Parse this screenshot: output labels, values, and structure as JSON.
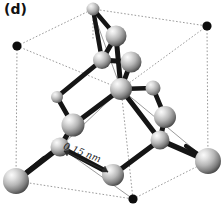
{
  "figure": {
    "panel_label": "(d)",
    "dimension_label": "0.15 nm",
    "structure_type": "diamond-cubic-unit-cell",
    "colors": {
      "background": "#ffffff",
      "bond": "#151515",
      "cube_edge_dashed": "#9a9a9a",
      "cube_edge_solid": "#8d8d8d",
      "corner_dot": "#0d0d0d",
      "sphere_highlight": "#f2f2f2",
      "sphere_mid": "#b4b4b4",
      "sphere_shadow": "#4a4a4a",
      "label_text": "#111111"
    },
    "cube_corners": [
      {
        "id": "back-top-left",
        "x": 17,
        "y": 46,
        "style": "black-dot",
        "r": 4.6
      },
      {
        "id": "back-top-right",
        "x": 207,
        "y": 26,
        "style": "black-dot",
        "r": 4.6
      },
      {
        "id": "front-top-left",
        "x": 4,
        "y": 110,
        "style": "hidden",
        "r": 0
      },
      {
        "id": "front-top-right",
        "x": 196,
        "y": 90,
        "style": "hidden",
        "r": 0
      },
      {
        "id": "back-bot-left",
        "x": 17,
        "y": 146,
        "style": "hidden",
        "r": 0
      },
      {
        "id": "back-bot-right",
        "x": 207,
        "y": 126,
        "style": "hidden",
        "r": 0
      },
      {
        "id": "front-bot-left",
        "x": 16,
        "y": 181,
        "style": "gray-sphere",
        "r": 13
      },
      {
        "id": "front-bot-center",
        "x": 133,
        "y": 199,
        "style": "black-dot",
        "r": 4.6
      },
      {
        "id": "front-bot-right",
        "x": 208,
        "y": 161,
        "style": "gray-sphere",
        "r": 13
      },
      {
        "id": "top-face-center",
        "x": 93,
        "y": 9,
        "style": "gray-sphere",
        "r": 6.5
      }
    ],
    "atoms": [
      {
        "id": "a-top-apex",
        "x": 93,
        "y": 9,
        "r": 6.5
      },
      {
        "id": "a-upper-right",
        "x": 116,
        "y": 36,
        "r": 10.5
      },
      {
        "id": "a-upper-mid",
        "x": 102,
        "y": 60,
        "r": 9
      },
      {
        "id": "a-upper-far",
        "x": 131,
        "y": 62,
        "r": 10.5
      },
      {
        "id": "a-center",
        "x": 121,
        "y": 89,
        "r": 11
      },
      {
        "id": "a-right-small",
        "x": 153,
        "y": 88,
        "r": 7.5
      },
      {
        "id": "a-left-small",
        "x": 57,
        "y": 97,
        "r": 6
      },
      {
        "id": "a-mid-left",
        "x": 73,
        "y": 125,
        "r": 11.5
      },
      {
        "id": "a-right-mid",
        "x": 165,
        "y": 117,
        "r": 11
      },
      {
        "id": "a-front-left",
        "x": 60,
        "y": 147,
        "r": 9.5
      },
      {
        "id": "a-front-right",
        "x": 160,
        "y": 140,
        "r": 9.5
      },
      {
        "id": "a-front-bot",
        "x": 113,
        "y": 175,
        "r": 11
      },
      {
        "id": "a-corner-bl",
        "x": 16,
        "y": 181,
        "r": 13
      },
      {
        "id": "a-corner-br",
        "x": 208,
        "y": 161,
        "r": 13
      }
    ],
    "bonds": [
      {
        "from": "a-top-apex",
        "to": "a-upper-right"
      },
      {
        "from": "a-top-apex",
        "to": "a-upper-mid"
      },
      {
        "from": "a-upper-right",
        "to": "a-upper-mid"
      },
      {
        "from": "a-upper-right",
        "to": "a-center"
      },
      {
        "from": "a-upper-mid",
        "to": "a-upper-far"
      },
      {
        "from": "a-upper-mid",
        "to": "a-left-small"
      },
      {
        "from": "a-upper-far",
        "to": "a-center"
      },
      {
        "from": "a-center",
        "to": "a-right-small"
      },
      {
        "from": "a-center",
        "to": "a-mid-left"
      },
      {
        "from": "a-right-small",
        "to": "a-right-mid"
      },
      {
        "from": "a-left-small",
        "to": "a-mid-left"
      },
      {
        "from": "a-mid-left",
        "to": "a-front-left"
      },
      {
        "from": "a-right-mid",
        "to": "a-front-right"
      },
      {
        "from": "a-front-left",
        "to": "a-corner-bl"
      },
      {
        "from": "a-front-left",
        "to": "a-front-bot"
      },
      {
        "from": "a-front-right",
        "to": "a-front-bot"
      },
      {
        "from": "a-front-right",
        "to": "a-corner-br"
      },
      {
        "from": "a-center",
        "to": "a-front-right"
      }
    ],
    "dimension_arrow": {
      "from": {
        "x": 63,
        "y": 150
      },
      "to": {
        "x": 110,
        "y": 172
      },
      "describes": "nearest-neighbour bond length"
    }
  }
}
